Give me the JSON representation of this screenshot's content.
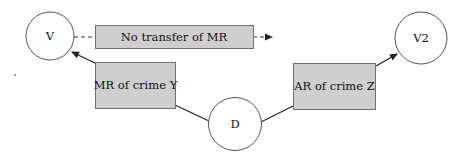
{
  "diagram": {
    "nodes": {
      "v": {
        "label": "V",
        "shape": "circle"
      },
      "v2": {
        "label": "V2",
        "shape": "circle"
      },
      "d": {
        "label": "D",
        "shape": "circle"
      }
    },
    "boxes": {
      "no_transfer": {
        "label": "No transfer of MR"
      },
      "mr_crime_y": {
        "label": "MR of crime Y"
      },
      "ar_crime_z": {
        "label": "AR of crime Z"
      }
    },
    "edges": [
      {
        "from": "no_transfer",
        "to": "v",
        "style": "dashed",
        "arrow": false
      },
      {
        "from": "no_transfer",
        "to": "(none)",
        "style": "dashed",
        "arrow": true
      },
      {
        "from": "mr_crime_y",
        "to": "v",
        "style": "solid",
        "arrow": true
      },
      {
        "from": "d",
        "to": "mr_crime_y",
        "style": "solid",
        "arrow": false
      },
      {
        "from": "d",
        "to": "ar_crime_z",
        "style": "solid",
        "arrow": false
      },
      {
        "from": "ar_crime_z",
        "to": "v2",
        "style": "solid",
        "arrow": true
      }
    ],
    "colors": {
      "box_fill": "#cfcfcf",
      "box_stroke": "#6e6e6e",
      "line": "#222222",
      "circle_stroke": "#555555"
    }
  }
}
